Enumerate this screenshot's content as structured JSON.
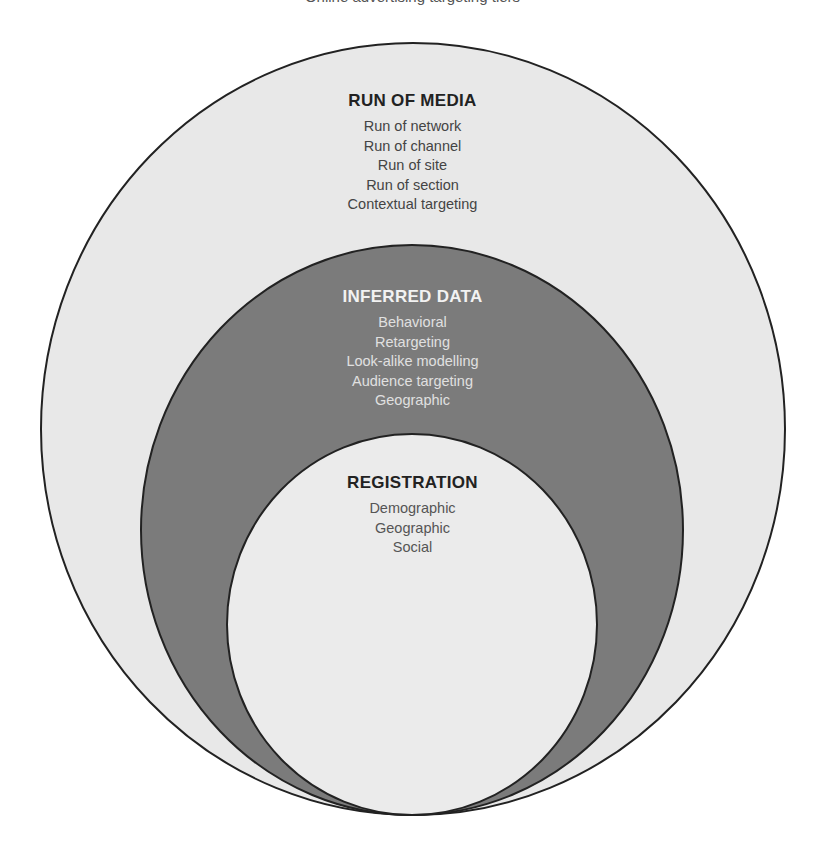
{
  "top_caption": "Online advertising targeting tiers",
  "colors": {
    "outer_fill": "#e8e8e8",
    "middle_fill": "#7b7b7b",
    "inner_fill": "#ebebeb",
    "stroke": "#222222"
  },
  "circles": {
    "outer": {
      "cx": 413,
      "cy": 429,
      "rx": 372,
      "ry": 386
    },
    "middle": {
      "cx": 412,
      "cy": 530,
      "rx": 271,
      "ry": 285
    },
    "inner": {
      "cx": 412,
      "cy": 624.5,
      "rx": 185,
      "ry": 190.5
    }
  },
  "tiers": {
    "run_of_media": {
      "title": "RUN OF MEDIA",
      "items": [
        "Run of network",
        "Run of channel",
        "Run of site",
        "Run of section",
        "Contextual targeting"
      ]
    },
    "inferred_data": {
      "title": "INFERRED DATA",
      "items": [
        "Behavioral",
        "Retargeting",
        "Look-alike modelling",
        "Audience targeting",
        "Geographic"
      ]
    },
    "registration": {
      "title": "REGISTRATION",
      "items": [
        "Demographic",
        "Geographic",
        "Social"
      ]
    }
  }
}
